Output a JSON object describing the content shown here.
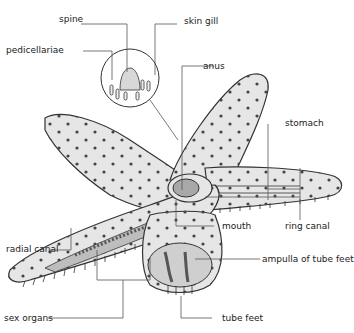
{
  "diagram": {
    "labels": {
      "spine": "spine",
      "skin_gill": "skin gill",
      "pedicellariae": "pedicellariae",
      "anus": "anus",
      "stomach": "stomach",
      "ring_canal": "ring canal",
      "mouth": "mouth",
      "ampulla": "ampulla of tube feet",
      "radial_canal": "radial canal",
      "sex_organs": "sex organs",
      "tube_feet": "tube feet"
    },
    "colors": {
      "body_fill": "#e4e4e4",
      "outline": "#333333",
      "leader_line": "#555555",
      "inner_organ": "#a8a8a8"
    }
  }
}
